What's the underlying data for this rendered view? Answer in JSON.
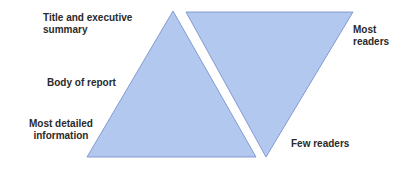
{
  "diagram": {
    "type": "inverted-pyramid-comparison",
    "colors": {
      "fill": "#b3c8ee",
      "stroke": "#6f88c9",
      "text": "#2a2a2a",
      "background": "#ffffff"
    },
    "left_triangle": {
      "description": "Upward triangle representing report structure",
      "labels": {
        "top": [
          "Title and executive",
          "summary"
        ],
        "middle": "Body of report",
        "bottom": [
          "Most detailed",
          "information"
        ]
      }
    },
    "right_triangle": {
      "description": "Inverted triangle representing readership",
      "labels": {
        "top": [
          "Most",
          "readers"
        ],
        "bottom": "Few readers"
      }
    }
  }
}
